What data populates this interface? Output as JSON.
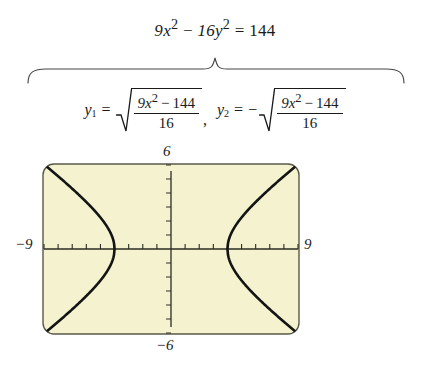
{
  "figure": {
    "name": "hyperbola-graphing-figure",
    "main_equation": {
      "coef_a": "9",
      "var_x": "x",
      "exp_x": "2",
      "operator": "−",
      "coef_b": "16",
      "var_y": "y",
      "exp_y": "2",
      "equals": "=",
      "rhs": "144",
      "full_text": "9x² − 16y² = 144"
    },
    "solutions": [
      {
        "id": "y1",
        "lhs": "y",
        "subscript": "1",
        "equals": "=",
        "sign": "",
        "numerator": "9x² − 144",
        "numerator_coef": "9",
        "numerator_var": "x",
        "numerator_exp": "2",
        "numerator_op": "−",
        "numerator_const": "144",
        "denominator": "16",
        "full_text": "y₁ = √((9x² − 144)/16)"
      },
      {
        "id": "y2",
        "lhs": "y",
        "subscript": "2",
        "equals": "=",
        "sign": "−",
        "numerator": "9x² − 144",
        "numerator_coef": "9",
        "numerator_var": "x",
        "numerator_exp": "2",
        "numerator_op": "−",
        "numerator_const": "144",
        "denominator": "16",
        "full_text": "y₂ = −√((9x² − 144)/16)"
      }
    ],
    "separator": ",",
    "brace": {
      "name": "underbrace",
      "direction": "down"
    }
  },
  "colors": {
    "ink": "#1a1a1a",
    "screen_fill": "#f4f2cf",
    "screen_border": "#5a5a4a",
    "curve": "#141414",
    "axis": "#2c2c24",
    "page_background": "#ffffff"
  },
  "chart_data": {
    "type": "line",
    "title": "",
    "subtitle": "",
    "xlabel": "",
    "ylabel": "",
    "xlim": [
      -9,
      9
    ],
    "ylim": [
      -6,
      6
    ],
    "xtick_labels": [
      "−9",
      "9"
    ],
    "ytick_labels": [
      "6",
      "−6"
    ],
    "xtick_interval": 1,
    "ytick_interval": 1,
    "grid": false,
    "legend": "none",
    "equation": "9x² − 16y² = 144",
    "curve_type": "hyperbola",
    "vertices": [
      [
        -4,
        0
      ],
      [
        4,
        0
      ]
    ],
    "asymptote_slopes": [
      0.75,
      -0.75
    ],
    "series": [
      {
        "name": "y1 = sqrt((9x^2-144)/16)",
        "x": [
          -9.0,
          -8.5,
          -8.0,
          -7.5,
          -7.0,
          -6.5,
          -6.0,
          -5.5,
          -5.0,
          -4.5,
          -4.25,
          -4.0
        ],
        "values": [
          6.04,
          5.62,
          5.2,
          4.77,
          4.33,
          3.88,
          3.35,
          2.83,
          2.25,
          1.53,
          1.12,
          0.0
        ]
      },
      {
        "name": "y2 = -sqrt((9x^2-144)/16)",
        "x": [
          -9.0,
          -8.5,
          -8.0,
          -7.5,
          -7.0,
          -6.5,
          -6.0,
          -5.5,
          -5.0,
          -4.5,
          -4.25,
          -4.0
        ],
        "values": [
          -6.04,
          -5.62,
          -5.2,
          -4.77,
          -4.33,
          -3.88,
          -3.35,
          -2.83,
          -2.25,
          -1.53,
          -1.12,
          0.0
        ]
      },
      {
        "name": "y1 right branch",
        "x": [
          4.0,
          4.25,
          4.5,
          5.0,
          5.5,
          6.0,
          6.5,
          7.0,
          7.5,
          8.0,
          8.5,
          9.0
        ],
        "values": [
          0.0,
          1.12,
          1.53,
          2.25,
          2.83,
          3.35,
          3.88,
          4.33,
          4.77,
          5.2,
          5.62,
          6.04
        ]
      },
      {
        "name": "y2 right branch",
        "x": [
          4.0,
          4.25,
          4.5,
          5.0,
          5.5,
          6.0,
          6.5,
          7.0,
          7.5,
          8.0,
          8.5,
          9.0
        ],
        "values": [
          0.0,
          -1.12,
          -1.53,
          -2.25,
          -2.83,
          -3.35,
          -3.88,
          -4.33,
          -4.77,
          -5.2,
          -5.62,
          -6.04
        ]
      }
    ]
  },
  "axis_labels": {
    "top": "6",
    "bottom": "−6",
    "left": "−9",
    "right": "9"
  }
}
